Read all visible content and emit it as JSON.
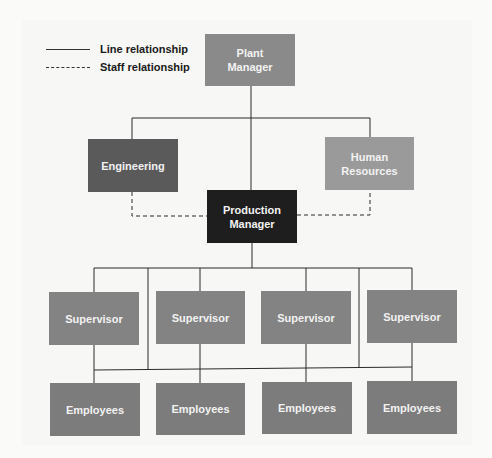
{
  "legend": {
    "items": [
      {
        "style": "solid",
        "label": "Line relationship"
      },
      {
        "style": "dashed",
        "label": "Staff relationship"
      }
    ]
  },
  "colors": {
    "plant_manager": "#8a8a8a",
    "engineering": "#5a5a5a",
    "human_resources": "#9a9a9a",
    "production_manager": "#1e1e1e",
    "supervisor": "#838383",
    "employees": "#7c7c7c",
    "line": "#2a2a2a",
    "box_text": "#f2f2f2"
  },
  "nodes": {
    "plant_manager": {
      "line1": "Plant",
      "line2": "Manager"
    },
    "engineering": {
      "line1": "Engineering"
    },
    "human_resources": {
      "line1": "Human",
      "line2": "Resources"
    },
    "production_manager": {
      "line1": "Production",
      "line2": "Manager"
    },
    "supervisors": [
      {
        "label": "Supervisor"
      },
      {
        "label": "Supervisor"
      },
      {
        "label": "Supervisor"
      },
      {
        "label": "Supervisor"
      }
    ],
    "employees": [
      {
        "label": "Employees"
      },
      {
        "label": "Employees"
      },
      {
        "label": "Employees"
      },
      {
        "label": "Employees"
      }
    ]
  }
}
